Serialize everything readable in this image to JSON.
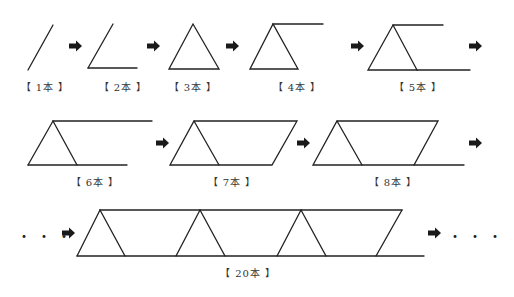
{
  "stroke_color": "#222222",
  "arrow_color": "#1a1a1a",
  "stages": [
    {
      "count": 1,
      "label": "【 1本 】"
    },
    {
      "count": 2,
      "label": "【 2本 】"
    },
    {
      "count": 3,
      "label": "【 3本 】"
    },
    {
      "count": 4,
      "label": "【 4本 】"
    },
    {
      "count": 5,
      "label": "【 5本 】"
    },
    {
      "count": 6,
      "label": "【 6本 】"
    },
    {
      "count": 7,
      "label": "【 7本 】"
    },
    {
      "count": 8,
      "label": "【 8本 】"
    },
    {
      "count": 20,
      "label": "【 20本 】"
    }
  ],
  "ellipsis_left": "・・・",
  "ellipsis_right": "・・・"
}
